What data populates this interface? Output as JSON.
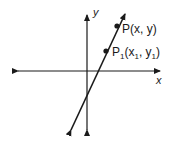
{
  "diagram": {
    "type": "coordinate-plane-line",
    "axes": {
      "x_label": "x",
      "y_label": "y"
    },
    "points": [
      {
        "name": "P",
        "label_main": "P",
        "label_rest": "(x, y)",
        "px": 117,
        "py": 25
      },
      {
        "name": "P1",
        "label_main": "P",
        "label_sub": "1",
        "label_open": "(x",
        "label_sub_x": "1",
        "label_mid": ", y",
        "label_sub_y": "1",
        "label_close": ")",
        "px": 106,
        "py": 51
      }
    ],
    "colors": {
      "stroke": "#1a1a1a",
      "background": "#ffffff"
    }
  }
}
